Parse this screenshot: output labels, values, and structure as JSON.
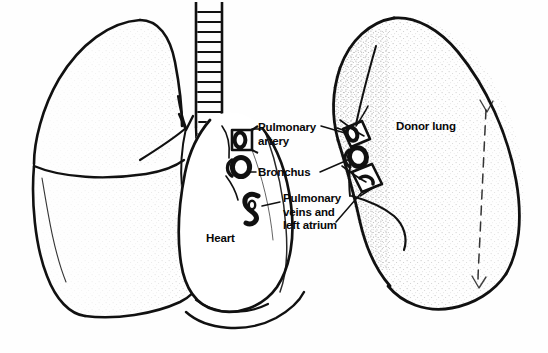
{
  "figure": {
    "background_color": "#fefefe",
    "ink_color": "#111111"
  },
  "labels": {
    "pulmonary_artery": "Pulmonary\nartery",
    "bronchus": "Bronchus",
    "pulmonary_veins": "Pulmonary\nveins and\nleft atrium",
    "heart": "Heart",
    "donor_lung": "Donor lung"
  },
  "anatomy": {
    "recipient_lung": "native left lung",
    "trachea": "trachea with cartilage rings",
    "heart": "heart",
    "donor_lung": "donor lung",
    "stumps": [
      "pulmonary artery stump",
      "bronchus stump",
      "pulmonary vein / left atrial cuff stump"
    ]
  }
}
